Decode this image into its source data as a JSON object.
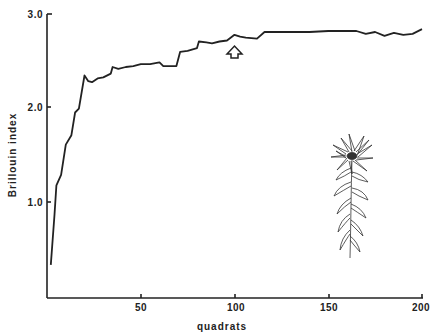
{
  "chart_data": {
    "type": "line",
    "title": "",
    "xlabel": "quadrats",
    "ylabel": "Brillouin index",
    "xlim": [
      0,
      200
    ],
    "ylim": [
      0,
      3.0
    ],
    "x_ticks": [
      50,
      100,
      150,
      200
    ],
    "x_tick_labels": [
      "50",
      "100",
      "150",
      "200"
    ],
    "y_ticks": [
      1.0,
      2.0,
      3.0
    ],
    "y_tick_labels": [
      "1.0",
      "2.0",
      "3.0"
    ],
    "grid": false,
    "legend": null,
    "series": [
      {
        "name": "Brillouin index",
        "x": [
          2,
          4,
          5,
          7.5,
          10,
          13,
          15,
          17,
          20,
          22,
          24,
          27,
          30,
          34,
          35,
          38,
          42,
          46,
          50,
          55,
          60,
          62,
          69,
          71,
          75,
          80,
          81,
          85,
          88,
          92,
          96,
          100,
          103,
          106,
          112,
          116,
          120,
          130,
          140,
          150,
          155,
          160,
          165,
          170,
          175,
          180,
          185,
          190,
          195,
          200
        ],
        "values": [
          0.35,
          0.88,
          1.19,
          1.3,
          1.62,
          1.72,
          1.96,
          2.0,
          2.35,
          2.29,
          2.28,
          2.32,
          2.33,
          2.37,
          2.44,
          2.42,
          2.44,
          2.45,
          2.47,
          2.47,
          2.49,
          2.45,
          2.45,
          2.6,
          2.61,
          2.64,
          2.71,
          2.7,
          2.69,
          2.71,
          2.72,
          2.78,
          2.76,
          2.75,
          2.74,
          2.81,
          2.81,
          2.81,
          2.81,
          2.82,
          2.82,
          2.82,
          2.82,
          2.79,
          2.81,
          2.77,
          2.8,
          2.78,
          2.79,
          2.84
        ]
      }
    ],
    "annotations": [
      {
        "type": "arrow-up",
        "x": 100,
        "y": 2.6,
        "note": "open upward arrow marker below the curve near quadrat 100"
      },
      {
        "type": "illustration",
        "description": "line drawing of a daisy-like flowering plant with narrow leaves",
        "position": "lower right"
      }
    ]
  }
}
